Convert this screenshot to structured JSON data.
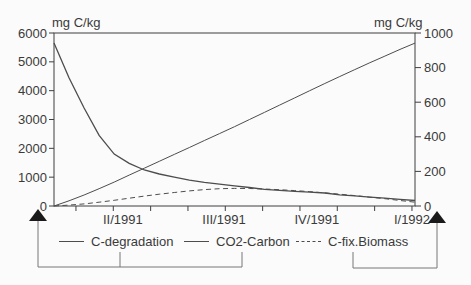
{
  "figure": {
    "left_axis_title": "mg C/kg",
    "right_axis_title": "mg C/kg",
    "colors": {
      "background": "#fbfbfb",
      "line": "#4d4d4d",
      "axis": "#3f3f3f",
      "text": "#3a3a3a",
      "connector": "#777777",
      "arrow_fill": "#1a1a1a"
    }
  },
  "legend": {
    "items": [
      {
        "label": "C-degradation",
        "style": "solid",
        "axis": "left"
      },
      {
        "label": "CO2-Carbon",
        "style": "solid",
        "axis": "left"
      },
      {
        "label": "C-fix.Biomass",
        "style": "dashed",
        "axis": "right"
      }
    ]
  },
  "annotations": {
    "left_arrow_series": [
      "C-degradation",
      "CO2-Carbon"
    ],
    "right_arrow_series": [
      "C-fix.Biomass"
    ]
  },
  "chart_data": {
    "type": "line",
    "title": "",
    "x_axis": {
      "unit": "months from start (estimated), quarter labels shown",
      "range_months": [
        0,
        12
      ],
      "labels": [
        {
          "text": "II/1991",
          "position_months": 2.29
        },
        {
          "text": "III/1991",
          "position_months": 5.65
        },
        {
          "text": "IV/1991",
          "position_months": 8.74
        },
        {
          "text": "I/1992",
          "position_months": 11.9
        }
      ]
    },
    "axes": {
      "left": {
        "title": "mg C/kg",
        "range": [
          0,
          6000
        ],
        "ticks": [
          0,
          1000,
          2000,
          3000,
          4000,
          5000,
          6000
        ]
      },
      "right": {
        "title": "mg C/kg",
        "range": [
          0,
          1000
        ],
        "ticks": [
          0,
          200,
          400,
          600,
          800,
          1000
        ]
      }
    },
    "x": [
      0,
      0.5,
      1,
      1.5,
      2,
      2.5,
      3,
      3.5,
      4,
      4.5,
      5,
      5.5,
      6,
      6.5,
      7,
      7.5,
      8,
      8.5,
      9,
      9.5,
      10,
      10.5,
      11,
      11.5,
      12
    ],
    "series": [
      {
        "name": "C-degradation",
        "axis": "left",
        "style": "solid",
        "values": [
          5650,
          4450,
          3400,
          2450,
          1800,
          1480,
          1250,
          1110,
          1000,
          900,
          820,
          755,
          700,
          640,
          580,
          545,
          510,
          480,
          450,
          390,
          350,
          310,
          270,
          230,
          190
        ]
      },
      {
        "name": "CO2-Carbon",
        "axis": "left",
        "style": "solid",
        "values": [
          0,
          180,
          380,
          600,
          830,
          1070,
          1310,
          1550,
          1790,
          2030,
          2270,
          2510,
          2750,
          3000,
          3250,
          3500,
          3750,
          4000,
          4250,
          4490,
          4730,
          4970,
          5200,
          5430,
          5650
        ]
      },
      {
        "name": "C-fix.Biomass",
        "axis": "right",
        "style": "dashed",
        "values": [
          0,
          5,
          12,
          22,
          33,
          45,
          57,
          68,
          78,
          87,
          95,
          100,
          102,
          101,
          98,
          94,
          89,
          83,
          76,
          68,
          60,
          51,
          42,
          32,
          22
        ]
      }
    ]
  }
}
